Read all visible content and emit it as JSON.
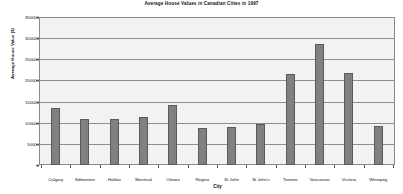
{
  "chart_data": {
    "type": "bar",
    "title": "Average House Values in Canadian Cities in 1997",
    "xlabel": "City",
    "ylabel": "Average House Value ($)",
    "categories": [
      "Calgary",
      "Edmonton",
      "Halifax",
      "Montreal",
      "Ottawa",
      "Regina",
      "St John",
      "St John's",
      "Toronto",
      "Vancouver",
      "Victoria",
      "Winnipeg"
    ],
    "values": [
      135000,
      110000,
      110000,
      113000,
      142000,
      88000,
      90000,
      97000,
      215000,
      287000,
      218000,
      92000
    ],
    "ylim": [
      0,
      350000
    ],
    "ytick_labels": [
      "350000",
      "300000",
      "250000",
      "200000",
      "150000",
      "100000",
      "50000",
      "0"
    ],
    "ytick_values": [
      350000,
      300000,
      250000,
      200000,
      150000,
      100000,
      50000,
      0
    ],
    "grid": true,
    "legend": false,
    "bar_color": "#808080",
    "plot_background": "#f2f2f2",
    "axis_color": "#8a8a8a",
    "gridline_color": "#8f8f8f",
    "text_color": "#111111"
  }
}
